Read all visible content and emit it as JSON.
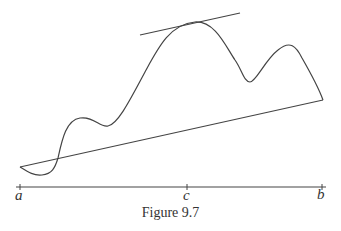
{
  "figure": {
    "caption": "Figure 9.7",
    "labels": {
      "a": "a",
      "c": "c",
      "b": "b"
    },
    "stroke_color": "#444444"
  }
}
